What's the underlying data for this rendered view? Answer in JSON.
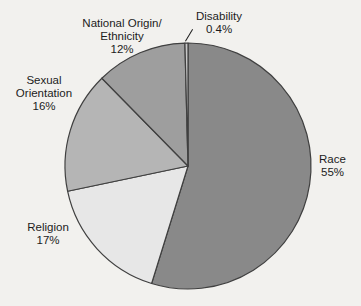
{
  "page": {
    "background_color": "#f2f1ee",
    "text_color": "#1c1c1c"
  },
  "chart_data": {
    "type": "pie",
    "title": "",
    "direction": "clockwise",
    "start_angle_deg": 0,
    "legend_position": "labels-around-pie",
    "stroke_color": "#404040",
    "categories": [
      "Race",
      "Religion",
      "Sexual Orientation",
      "National Origin/Ethnicity",
      "Disability"
    ],
    "values": [
      55,
      17,
      16,
      12,
      0.4
    ],
    "slices": [
      {
        "id": "race",
        "label_lines": [
          "Race"
        ],
        "pct_label": "55%",
        "value": 55,
        "color": "#898989"
      },
      {
        "id": "religion",
        "label_lines": [
          "Religion"
        ],
        "pct_label": "17%",
        "value": 17,
        "color": "#e7e7e7"
      },
      {
        "id": "sexual-orientation",
        "label_lines": [
          "Sexual",
          "Orientation"
        ],
        "pct_label": "16%",
        "value": 16,
        "color": "#b5b5b5"
      },
      {
        "id": "national-origin",
        "label_lines": [
          "National Origin/",
          "Ethnicity"
        ],
        "pct_label": "12%",
        "value": 12,
        "color": "#9e9e9e"
      },
      {
        "id": "disability",
        "label_lines": [
          "Disability"
        ],
        "pct_label": "0.4%",
        "value": 0.4,
        "color": "#c7c7c7"
      }
    ]
  }
}
